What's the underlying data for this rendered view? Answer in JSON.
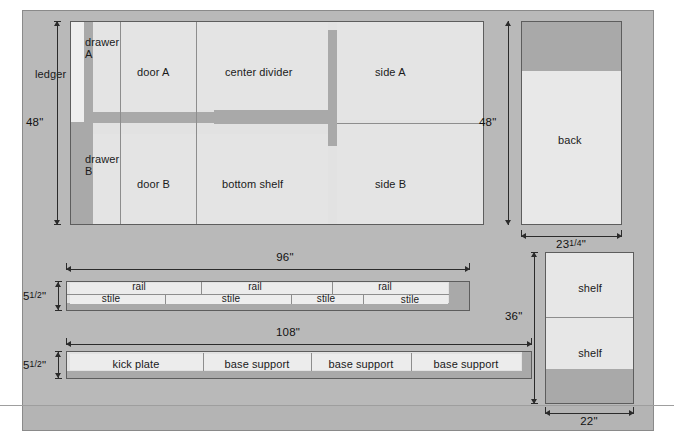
{
  "diagram": {
    "type": "cut-list-layout"
  },
  "sheets": [
    {
      "id": "sheet-main",
      "name": "main-plywood-sheet",
      "dim_height": "48\"",
      "parts": [
        {
          "name": "ledger",
          "label": "ledger"
        },
        {
          "name": "drawer-a",
          "label": "drawer\nA"
        },
        {
          "name": "door-a",
          "label": "door A"
        },
        {
          "name": "center-divider",
          "label": "center divider"
        },
        {
          "name": "side-a",
          "label": "side A"
        },
        {
          "name": "drawer-b",
          "label": "drawer\nB"
        },
        {
          "name": "door-b",
          "label": "door B"
        },
        {
          "name": "bottom-shelf",
          "label": "bottom shelf"
        },
        {
          "name": "side-b",
          "label": "side B"
        }
      ]
    },
    {
      "id": "sheet-back",
      "name": "back-panel-sheet",
      "dim_height": "48\"",
      "dim_width_whole": "23",
      "dim_width_frac": "1/4",
      "dim_width": "23 1/4\"",
      "parts": [
        {
          "name": "back",
          "label": "back"
        }
      ]
    },
    {
      "id": "sheet-rails",
      "name": "rail-stile-board",
      "dim_length": "96\"",
      "dim_width_whole": "5",
      "dim_width_frac": "1/2",
      "dim_width": "5 1/2\"",
      "rails": [
        {
          "name": "rail-1",
          "label": "rail"
        },
        {
          "name": "rail-2",
          "label": "rail"
        },
        {
          "name": "rail-3",
          "label": "rail"
        }
      ],
      "stiles": [
        {
          "name": "stile-1",
          "label": "stile"
        },
        {
          "name": "stile-2",
          "label": "stile"
        },
        {
          "name": "stile-3",
          "label": "stile"
        },
        {
          "name": "stile-4",
          "label": "stile"
        }
      ]
    },
    {
      "id": "sheet-base",
      "name": "kick-plate-board",
      "dim_length": "108\"",
      "dim_width_whole": "5",
      "dim_width_frac": "1/2",
      "dim_width": "5 1/2\"",
      "parts": [
        {
          "name": "kick-plate",
          "label": "kick plate"
        },
        {
          "name": "base-support-1",
          "label": "base support"
        },
        {
          "name": "base-support-2",
          "label": "base support"
        },
        {
          "name": "base-support-3",
          "label": "base support"
        }
      ]
    },
    {
      "id": "sheet-shelves",
      "name": "shelf-sheet",
      "dim_height": "36\"",
      "dim_width": "22\"",
      "parts": [
        {
          "name": "shelf-upper",
          "label": "shelf"
        },
        {
          "name": "shelf-lower",
          "label": "shelf"
        }
      ]
    }
  ],
  "colors": {
    "mat": "#b9b9b9",
    "panel": "#e2e2e2",
    "piece": "#e4e4e4",
    "waste": "#a9a9a9",
    "outline": "#5d5d5d",
    "ink": "#111111"
  }
}
